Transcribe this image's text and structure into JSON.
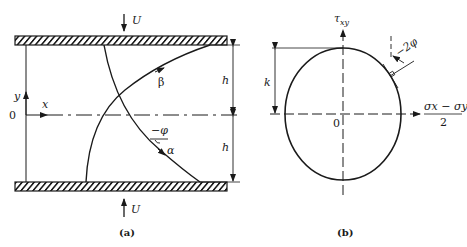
{
  "figure_a": {
    "caption": "(a)",
    "top_velocity": "U",
    "bottom_velocity": "U",
    "y_axis": "y",
    "x_axis": "x",
    "origin": "0",
    "half_height_top": "h",
    "half_height_bottom": "h",
    "beta_line": "β",
    "alpha_line": "α",
    "angle": "−φ"
  },
  "figure_b": {
    "caption": "(b)",
    "y_axis": "τxy",
    "y_axis_base": "τ",
    "y_axis_sub": "xy",
    "x_axis_num": "σx − σy",
    "x_axis_den": "2",
    "origin": "0",
    "radius": "k",
    "angle": "−2φ"
  },
  "colors": {
    "ink": "#1a1a1a",
    "background": "#ffffff"
  }
}
